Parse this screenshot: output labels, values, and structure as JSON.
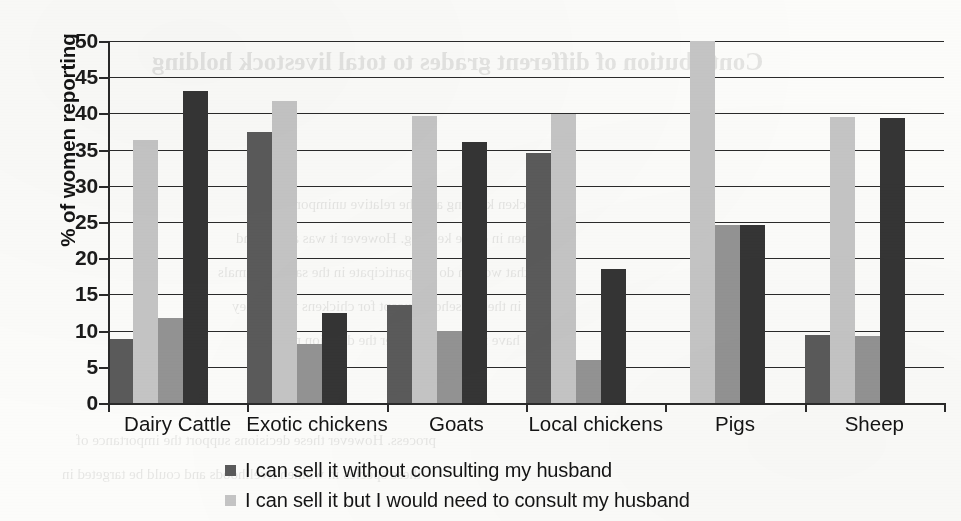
{
  "chart_data": {
    "type": "bar",
    "title": "",
    "xlabel": "",
    "ylabel": "% of women reporting",
    "ylim": [
      0,
      50
    ],
    "yticks": [
      0,
      5,
      10,
      15,
      20,
      25,
      30,
      35,
      40,
      45,
      50
    ],
    "ytick_labels": [
      "0",
      "5",
      "10",
      "15",
      "20",
      "25",
      "30",
      "35",
      "40",
      "45",
      "50"
    ],
    "grid": true,
    "legend_position": "bottom",
    "categories": [
      "Dairy Cattle",
      "Exotic chickens",
      "Goats",
      "Local chickens",
      "Pigs",
      "Sheep"
    ],
    "series": [
      {
        "name": "I can sell it without consulting my husband",
        "color": "#5b5b5b",
        "values": [
          8.8,
          37.5,
          13.6,
          34.6,
          0,
          9.4
        ]
      },
      {
        "name": "I can sell it but I would need to consult my husband",
        "color": "#c6c6c6",
        "values": [
          36.3,
          41.7,
          39.6,
          39.9,
          50.0,
          39.5
        ]
      },
      {
        "name": "series-3",
        "color": "#949494",
        "values": [
          11.7,
          8.2,
          9.9,
          5.9,
          24.6,
          9.2
        ]
      },
      {
        "name": "series-4",
        "color": "#353535",
        "values": [
          43.1,
          12.4,
          36.0,
          18.5,
          24.6,
          39.4
        ]
      }
    ]
  },
  "legend": {
    "entries": [
      {
        "label": "I can sell it without consulting my husband",
        "color": "#5b5b5b"
      },
      {
        "label": "I can sell it but I would need to consult my husband",
        "color": "#c6c6c6"
      }
    ]
  },
  "bleed_through": {
    "heading": "Contribution of different grades to total livestock holding",
    "lines": [
      "chicken keeping and the relative unimportance of",
      "women in cattle keeping. However it was also found",
      "that women do not participate in the sale of animals",
      "in the household except for chickens where they",
      "have more control over the decision making",
      "process. However these decisions support the importance of",
      "these species in women livelihoods and could be targeted in"
    ]
  }
}
